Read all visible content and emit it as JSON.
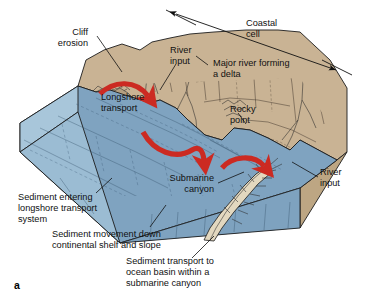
{
  "figure": {
    "panel_label": "a",
    "type": "block-diagram"
  },
  "colors": {
    "ocean_surface": "#7fa3c0",
    "ocean_shelf": "#8cadc6",
    "ocean_front_face": "#7ea2bf",
    "ocean_left_face": "#a8c6da",
    "land_top": "#c9b394",
    "land_shadow": "#b49f80",
    "land_side": "#bda683",
    "canyon_fill": "#e3d8bf",
    "arrow_red": "#cc2a22",
    "outline": "#1c1c1c",
    "text": "#111111",
    "background": "#ffffff"
  },
  "labels": {
    "cliff_erosion": [
      "Cliff",
      "erosion"
    ],
    "river_input_top": [
      "River",
      "input"
    ],
    "coastal_cell": [
      "Coastal",
      "cell"
    ],
    "major_river_delta": [
      "Major river forming",
      "a delta"
    ],
    "longshore_transport": [
      "Longshore",
      "transport"
    ],
    "rocky_point": [
      "Rocky",
      "point"
    ],
    "submarine_canyon": [
      "Submarine",
      "canyon"
    ],
    "river_input_right": [
      "River",
      "input"
    ],
    "sediment_entering": [
      "Sediment entering",
      "longshore transport",
      "system"
    ],
    "sediment_movement": [
      "Sediment movement down",
      "continental shelf and slope"
    ],
    "sediment_transport_basin": [
      "Sediment transport to",
      "ocean basin within a",
      "submarine canyon"
    ]
  },
  "annotations": {
    "coastal_cell_span": "double-headed arrow spanning the full coastal cell across the top of the block",
    "longshore_arrows_count": 3,
    "longshore_arrow_direction": "left to right along the shoreline",
    "panel_letter": "a"
  }
}
